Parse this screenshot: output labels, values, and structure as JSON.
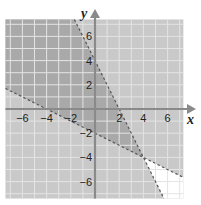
{
  "chart_data": {
    "type": "inequality-region",
    "title": "",
    "xlabel": "x",
    "ylabel": "y",
    "xlim": [
      -7.4,
      7.3
    ],
    "ylim": [
      -7.4,
      7.4
    ],
    "grid": true,
    "grid_step": 1,
    "x_ticks": [
      -6,
      -4,
      -2,
      2,
      4,
      6
    ],
    "y_ticks": [
      6,
      4,
      2,
      -2,
      -4,
      -6
    ],
    "x_tick_labels": [
      "−6",
      "−4",
      "−2",
      "2",
      "4",
      "6"
    ],
    "y_tick_labels": [
      "6",
      "4",
      "2",
      "−2",
      "−4",
      "−6"
    ],
    "boundary_lines": [
      {
        "name": "line-1",
        "equation": "y = -2x + 4",
        "slope": -2,
        "intercept": 4,
        "style": "dashed",
        "points": [
          [
            0,
            4
          ],
          [
            2,
            0
          ]
        ]
      },
      {
        "name": "line-2",
        "equation": "y = -0.5x - 2",
        "slope": -0.5,
        "intercept": -2,
        "style": "dashed",
        "points": [
          [
            -4,
            0
          ],
          [
            0,
            -2
          ]
        ]
      }
    ],
    "intersection": [
      4,
      -4
    ],
    "regions": [
      {
        "name": "overlap",
        "description": "below y=-2x+4 and above y=-0.5x-2",
        "fill": "#a9a9a9"
      },
      {
        "name": "single",
        "description": "satisfies exactly one inequality",
        "fill": "#c9c9c9"
      },
      {
        "name": "none",
        "description": "above y=-2x+4 and below y=-0.5x-2",
        "fill": "#ffffff"
      }
    ]
  },
  "colors": {
    "dark_region": "#a9a9a9",
    "medium_region": "#c9c9c9",
    "empty_region": "#ffffff",
    "grid_line": "#e4e4e4",
    "axis": "#8a8a8a",
    "boundary": "#555555"
  },
  "labels": {
    "x_axis": "x",
    "y_axis": "y"
  }
}
